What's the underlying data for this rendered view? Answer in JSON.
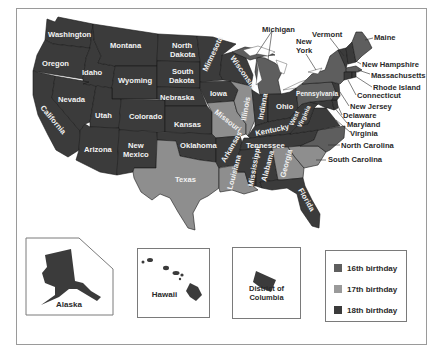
{
  "map": {
    "colors": {
      "16th": "#5e5e5e",
      "17th": "#8e8e8e",
      "18th": "#3b3b3b",
      "water": "#ffffff",
      "border": "#1a1a1a"
    },
    "states": [
      {
        "name": "Washington",
        "category": "18th"
      },
      {
        "name": "Oregon",
        "category": "18th"
      },
      {
        "name": "California",
        "category": "18th"
      },
      {
        "name": "Idaho",
        "category": "18th"
      },
      {
        "name": "Nevada",
        "category": "18th"
      },
      {
        "name": "Montana",
        "category": "18th"
      },
      {
        "name": "Wyoming",
        "category": "18th"
      },
      {
        "name": "Utah",
        "category": "18th"
      },
      {
        "name": "Colorado",
        "category": "18th"
      },
      {
        "name": "Arizona",
        "category": "18th"
      },
      {
        "name": "New Mexico",
        "category": "18th"
      },
      {
        "name": "North Dakota",
        "category": "18th"
      },
      {
        "name": "South Dakota",
        "category": "18th"
      },
      {
        "name": "Nebraska",
        "category": "18th"
      },
      {
        "name": "Kansas",
        "category": "18th"
      },
      {
        "name": "Oklahoma",
        "category": "18th"
      },
      {
        "name": "Texas",
        "category": "17th"
      },
      {
        "name": "Minnesota",
        "category": "18th"
      },
      {
        "name": "Iowa",
        "category": "18th"
      },
      {
        "name": "Missouri",
        "category": "17th"
      },
      {
        "name": "Arkansas",
        "category": "18th"
      },
      {
        "name": "Louisiana",
        "category": "17th"
      },
      {
        "name": "Wisconsin",
        "category": "18th"
      },
      {
        "name": "Illinois",
        "category": "17th"
      },
      {
        "name": "Michigan",
        "category": "16th"
      },
      {
        "name": "Indiana",
        "category": "18th"
      },
      {
        "name": "Ohio",
        "category": "18th"
      },
      {
        "name": "Kentucky",
        "category": "18th"
      },
      {
        "name": "Tennessee",
        "category": "18th"
      },
      {
        "name": "Mississippi",
        "category": "18th"
      },
      {
        "name": "Alabama",
        "category": "18th"
      },
      {
        "name": "Georgia",
        "category": "17th"
      },
      {
        "name": "Florida",
        "category": "18th"
      },
      {
        "name": "South Carolina",
        "category": "17th"
      },
      {
        "name": "North Carolina",
        "category": "16th"
      },
      {
        "name": "Virginia",
        "category": "18th"
      },
      {
        "name": "West Virginia",
        "category": "18th"
      },
      {
        "name": "Maryland",
        "category": "18th"
      },
      {
        "name": "Delaware",
        "category": "18th"
      },
      {
        "name": "Pennsylvania",
        "category": "16th"
      },
      {
        "name": "New Jersey",
        "category": "18th"
      },
      {
        "name": "New York",
        "category": "16th"
      },
      {
        "name": "Connecticut",
        "category": "18th"
      },
      {
        "name": "Rhode Island",
        "category": "18th"
      },
      {
        "name": "Massachusetts",
        "category": "16th"
      },
      {
        "name": "Vermont",
        "category": "18th"
      },
      {
        "name": "New Hampshire",
        "category": "18th"
      },
      {
        "name": "Maine",
        "category": "16th"
      },
      {
        "name": "Alaska",
        "category": "18th"
      },
      {
        "name": "Hawaii",
        "category": "18th"
      },
      {
        "name": "District of Columbia",
        "category": "18th"
      }
    ],
    "labels": {
      "washington": "Washington",
      "oregon": "Oregon",
      "california": "California",
      "idaho": "Idaho",
      "nevada": "Nevada",
      "montana": "Montana",
      "wyoming": "Wyoming",
      "utah": "Utah",
      "colorado": "Colorado",
      "arizona": "Arizona",
      "new_mexico_1": "New",
      "new_mexico_2": "Mexico",
      "north_dakota_1": "North",
      "north_dakota_2": "Dakota",
      "south_dakota_1": "South",
      "south_dakota_2": "Dakota",
      "nebraska": "Nebraska",
      "kansas": "Kansas",
      "oklahoma": "Oklahoma",
      "texas": "Texas",
      "minnesota": "Minnesota",
      "iowa": "Iowa",
      "missouri": "Missouri",
      "arkansas": "Arkansas",
      "louisiana": "Louisiana",
      "wisconsin": "Wisconsin",
      "illinois": "Illinois",
      "michigan": "Michigan",
      "indiana": "Indiana",
      "ohio": "Ohio",
      "kentucky": "Kentucky",
      "tennessee": "Tennessee",
      "mississippi": "Mississippi",
      "alabama": "Alabama",
      "georgia": "Georgia",
      "florida": "Florida",
      "south_carolina": "South Carolina",
      "north_carolina": "North Carolina",
      "virginia": "Virginia",
      "west_virginia_1": "West",
      "west_virginia_2": "Virginia",
      "maryland": "Maryland",
      "delaware": "Delaware",
      "pennsylvania": "Pennsylvania",
      "new_jersey": "New Jersey",
      "new_york_1": "New",
      "new_york_2": "York",
      "connecticut": "Connecticut",
      "rhode_island": "Rhode Island",
      "massachusetts": "Massachusetts",
      "vermont": "Vermont",
      "new_hampshire": "New Hampshire",
      "maine": "Maine"
    }
  },
  "insets": {
    "alaska": "Alaska",
    "hawaii": "Hawaii",
    "dc": "District of Columbia"
  },
  "legend": {
    "items": [
      {
        "label": "16th birthday",
        "color": "#5e5e5e"
      },
      {
        "label": "17th birthday",
        "color": "#9a9a9a"
      },
      {
        "label": "18th birthday",
        "color": "#3b3b3b"
      }
    ]
  }
}
